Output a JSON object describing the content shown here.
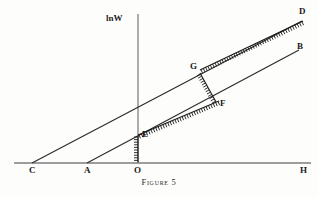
{
  "figure": {
    "caption": "Figure 5",
    "axis": {
      "y_label": "lnW",
      "x_axis_name": "horizontal-axis",
      "y_axis_name": "vertical-axis"
    },
    "points": [
      {
        "id": "C",
        "label": "C",
        "x": 32,
        "y": 163,
        "label_x": 29,
        "label_y": 166
      },
      {
        "id": "A",
        "label": "A",
        "x": 87,
        "y": 163,
        "label_x": 84,
        "label_y": 166
      },
      {
        "id": "O",
        "label": "O",
        "x": 138,
        "y": 163,
        "label_x": 134,
        "label_y": 166
      },
      {
        "id": "H",
        "label": "H",
        "x": 305,
        "y": 163,
        "label_x": 300,
        "label_y": 166
      },
      {
        "id": "D",
        "label": "D",
        "x": 302,
        "y": 21,
        "label_x": 299,
        "label_y": 8
      },
      {
        "id": "B",
        "label": "B",
        "x": 299,
        "y": 50,
        "label_x": 297,
        "label_y": 43
      },
      {
        "id": "G",
        "label": "G",
        "x": 199,
        "y": 71,
        "label_x": 191,
        "label_y": 63
      },
      {
        "id": "F",
        "label": "F",
        "x": 217,
        "y": 103,
        "label_x": 220,
        "label_y": 100
      },
      {
        "id": "E",
        "label": "E",
        "x": 138,
        "y": 135,
        "label_x": 142,
        "label_y": 132
      }
    ],
    "lines": [
      {
        "name": "line-C-to-D",
        "from": "C",
        "to": "D",
        "style": "plain",
        "x1": 32,
        "y1": 163,
        "x2": 302,
        "y2": 21
      },
      {
        "name": "line-A-to-B",
        "from": "A",
        "to": "B",
        "style": "plain",
        "x1": 87,
        "y1": 163,
        "x2": 299,
        "y2": 50
      },
      {
        "name": "hatched-E-to-F",
        "from": "E",
        "to": "F",
        "style": "hatched",
        "x1": 138,
        "y1": 135,
        "x2": 219,
        "y2": 101
      },
      {
        "name": "hatched-G-to-D",
        "from": "G",
        "to": "D",
        "style": "hatched",
        "x1": 200,
        "y1": 70,
        "x2": 303,
        "y2": 21
      },
      {
        "name": "hatched-G-to-F",
        "from": "G",
        "to": "F",
        "style": "hatched",
        "x1": 200,
        "y1": 73,
        "x2": 216,
        "y2": 102
      },
      {
        "name": "hatched-E-to-O",
        "from": "E",
        "to": "O",
        "style": "hatched",
        "x1": 138,
        "y1": 136,
        "x2": 138,
        "y2": 162
      }
    ],
    "colors": {
      "ink": "#1a1a1a",
      "axis": "#4a4a4a",
      "background": "#fdfdfc"
    }
  }
}
